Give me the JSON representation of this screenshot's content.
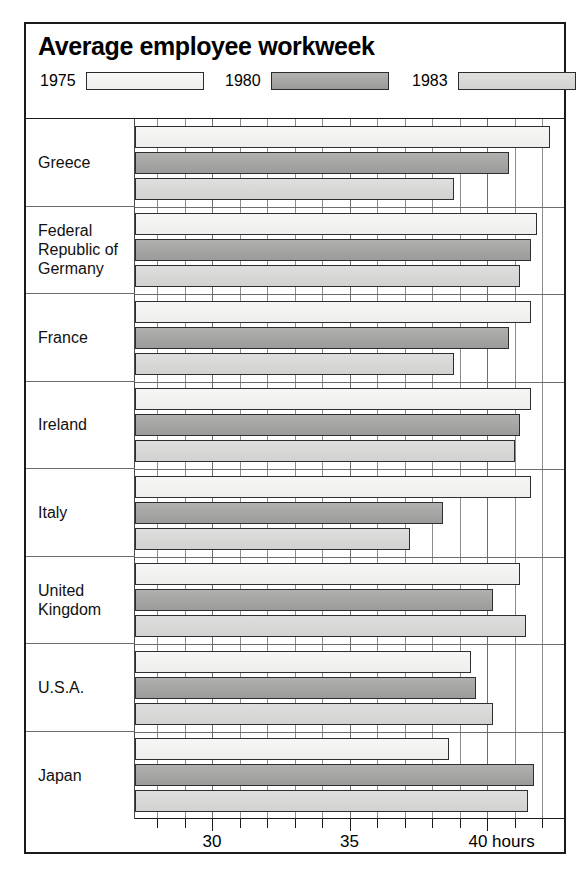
{
  "chart_data": {
    "type": "bar",
    "orientation": "horizontal",
    "title": "Average employee workweek",
    "xlabel": "hours",
    "ylabel": "",
    "xlim": [
      27.2,
      42.8
    ],
    "grid": true,
    "legend_position": "top",
    "axis_unit_label": "hours",
    "tick_labels": [
      "30",
      "35",
      "40 hours"
    ],
    "tick_values": [
      30,
      35,
      40
    ],
    "minor_tick_values": [
      28,
      29,
      31,
      32,
      33,
      34,
      36,
      37,
      38,
      39,
      41,
      42
    ],
    "categories": [
      "Greece",
      "Federal Republic of Germany",
      "France",
      "Ireland",
      "Italy",
      "United Kingdom",
      "U.S.A.",
      "Japan"
    ],
    "series": [
      {
        "name": "1975",
        "color": "#f2f2f0",
        "values": [
          42.3,
          41.8,
          41.6,
          41.6,
          41.6,
          41.2,
          39.4,
          38.6
        ]
      },
      {
        "name": "1980",
        "color": "#a8a8a8",
        "values": [
          40.8,
          41.6,
          40.8,
          41.2,
          38.4,
          40.2,
          39.6,
          41.7
        ]
      },
      {
        "name": "1983",
        "color": "#d8d8d6",
        "values": [
          38.8,
          41.2,
          38.8,
          41.0,
          37.2,
          41.4,
          40.2,
          41.5
        ]
      }
    ]
  },
  "legend": {
    "entries": [
      {
        "label": "1975",
        "x": 0
      },
      {
        "label": "1980",
        "x": 185
      },
      {
        "label": "1983",
        "x": 372
      }
    ]
  }
}
